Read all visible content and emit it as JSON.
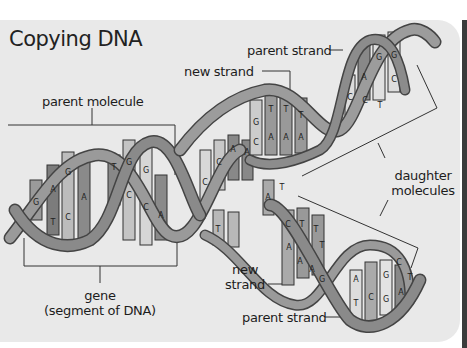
{
  "title": "Copying DNA",
  "labels": {
    "parent_molecule": "parent molecule",
    "parent_strand_top": "parent strand",
    "new_strand_top": "new strand",
    "daughter_line1": "daughter",
    "daughter_line2": "molecules",
    "new_strand_bottom_line1": "new",
    "new_strand_bottom_line2": "strand",
    "parent_strand_bottom": "parent strand",
    "gene_line1": "gene",
    "gene_line2": "(segment of DNA)"
  },
  "bases": {
    "parent_helix": [
      "G",
      "A",
      "T",
      "G",
      "C",
      "A",
      "T",
      "G",
      "C",
      "G",
      "C",
      "A"
    ],
    "replication_fork": [
      "C",
      "C",
      "G",
      "C",
      "A",
      "A",
      "G",
      "G",
      "T",
      "T",
      "A",
      "T"
    ],
    "top_daughter": [
      "G",
      "T",
      "T",
      "T",
      "C",
      "A",
      "A",
      "A",
      "G",
      "A",
      "C",
      "C",
      "G",
      "G",
      "T"
    ],
    "bottom_daughter": [
      "C",
      "T",
      "T",
      "T",
      "A",
      "A",
      "A",
      "G",
      "A",
      "T",
      "G",
      "C",
      "G",
      "C",
      "T",
      "A"
    ]
  },
  "colors": {
    "background": "#e9e9e9",
    "ribbon": "#8a8a8a",
    "ribbon_dark": "#4a4a4a",
    "text": "#1d1d1d"
  }
}
